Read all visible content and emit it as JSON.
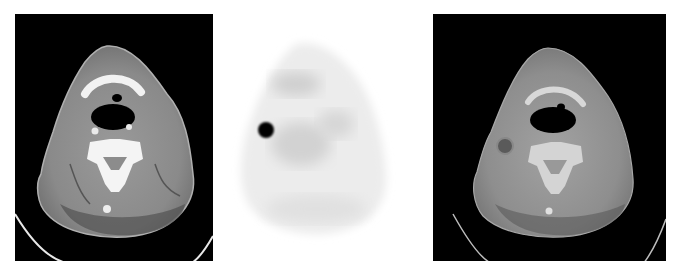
{
  "figure": {
    "panels": [
      {
        "id": "ct",
        "label": "CT axial neck slice",
        "background": "#000000"
      },
      {
        "id": "pet",
        "label": "PET axial neck slice",
        "background": "#ffffff",
        "hotspot": "focal uptake right neck node"
      },
      {
        "id": "fused",
        "label": "Fused PET/CT axial neck slice",
        "background": "#000000"
      }
    ],
    "caption": ""
  }
}
